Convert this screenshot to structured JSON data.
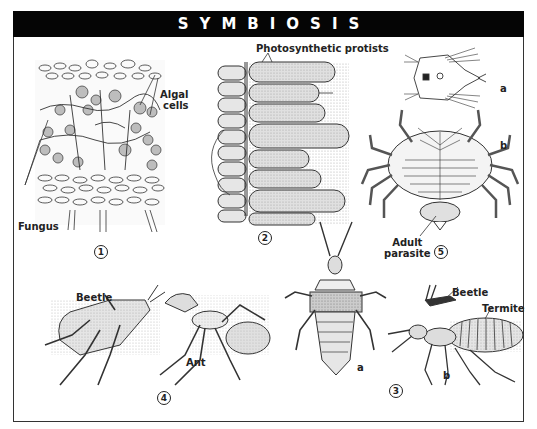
{
  "title": "SYMBIOSIS",
  "panels": [
    {
      "number": "1",
      "labels": {
        "algal": "Algal",
        "algal2": "cells",
        "fungus": "Fungus"
      }
    },
    {
      "number": "2",
      "labels": {
        "protists": "Photosynthetic protists"
      }
    },
    {
      "number": "3",
      "labels": {
        "a": "a",
        "b": "b",
        "beetle": "Beetle",
        "termite": "Termite"
      }
    },
    {
      "number": "4",
      "labels": {
        "beetle": "Beetle",
        "ant": "Ant"
      }
    },
    {
      "number": "5",
      "labels": {
        "a": "a",
        "b": "b",
        "adult": "Adult",
        "parasite": "parasite"
      }
    }
  ],
  "colors": {
    "title_bg": "#050505",
    "title_fg": "#ffffff",
    "ink": "#222222",
    "stipple": "#bdbdbd"
  }
}
